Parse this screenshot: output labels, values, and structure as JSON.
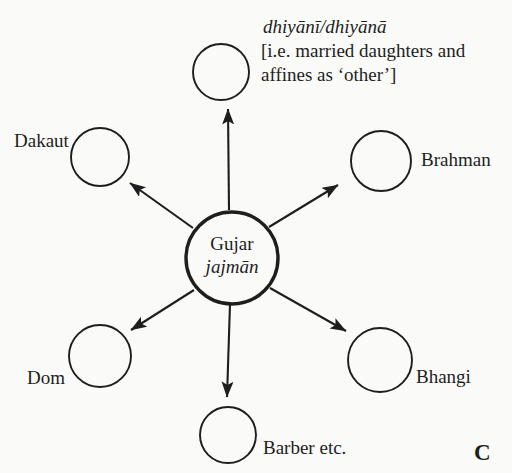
{
  "diagram": {
    "type": "radial-diagram",
    "center_node": {
      "line1": "Gujar",
      "line2": "jajmān"
    },
    "nodes": [
      {
        "id": "dhiyani",
        "label_lines": [
          "dhiyānī/dhiyānā",
          "[i.e. married daughters and",
          "affines as ‘other’]"
        ]
      },
      {
        "id": "dakaut",
        "label": "Dakaut"
      },
      {
        "id": "brahman",
        "label": "Brahman"
      },
      {
        "id": "dom",
        "label": "Dom"
      },
      {
        "id": "bhangi",
        "label": "Bhangi"
      },
      {
        "id": "barber",
        "label": "Barber etc."
      }
    ],
    "figure_label": "C",
    "colors": {
      "ink": "#1e1e1e",
      "background": "#fafaf8"
    }
  }
}
